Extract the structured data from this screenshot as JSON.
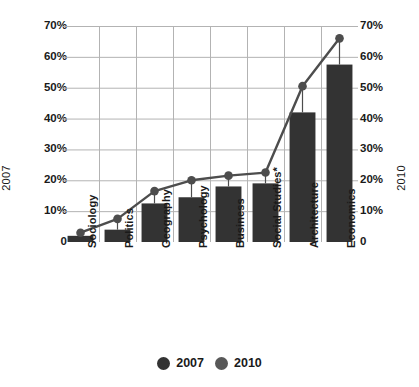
{
  "chart_data": {
    "type": "bar",
    "title": "",
    "subtitle": "",
    "xlabel": "",
    "ylabel_left": "2007",
    "ylabel_right": "2010",
    "categories": [
      "Sociology",
      "Politics",
      "Geography",
      "Psychology",
      "Business",
      "Social Studies*",
      "Architecture",
      "Economics"
    ],
    "series": [
      {
        "name": "2007",
        "type": "bar",
        "values": [
          2,
          4,
          12.5,
          14.5,
          18,
          19,
          42,
          57.5
        ]
      },
      {
        "name": "2010",
        "type": "line",
        "values": [
          3,
          7.5,
          16.5,
          20,
          21.5,
          22.5,
          50.5,
          66
        ]
      }
    ],
    "ylim": [
      0,
      70
    ],
    "yticks": [
      0,
      10,
      20,
      30,
      40,
      50,
      60,
      70
    ],
    "ytick_labels": [
      "0",
      "10%",
      "20%",
      "30%",
      "40%",
      "50%",
      "60%",
      "70%"
    ],
    "grid": true,
    "grid_vertical": true,
    "legend_position": "bottom",
    "legend": [
      "2007",
      "2010"
    ]
  },
  "colors": {
    "bar": "#333333",
    "line": "#4d4d4d",
    "marker": "#4d4d4d",
    "grid": "#b3b3b3",
    "axis": "#555555",
    "text": "#1a1a1a",
    "background": "#ffffff"
  },
  "legend": {
    "items": [
      {
        "label": "2007",
        "color": "#333333",
        "icon": "circle-marker-icon"
      },
      {
        "label": "2010",
        "color": "#585858",
        "icon": "circle-marker-icon"
      }
    ]
  }
}
